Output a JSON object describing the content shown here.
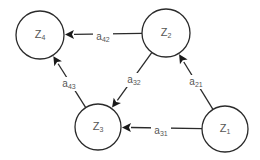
{
  "diagram": {
    "type": "directed-graph",
    "colors": {
      "stroke": "#2a2a2a",
      "text": "#555555",
      "background": "#ffffff"
    },
    "nodes": [
      {
        "id": "Z4",
        "base": "Z",
        "sub": "4",
        "cx": 40,
        "cy": 35,
        "r": 24
      },
      {
        "id": "Z2",
        "base": "Z",
        "sub": "2",
        "cx": 166,
        "cy": 33,
        "r": 24
      },
      {
        "id": "Z3",
        "base": "Z",
        "sub": "3",
        "cx": 98,
        "cy": 127,
        "r": 23
      },
      {
        "id": "Z1",
        "base": "Z",
        "sub": "1",
        "cx": 225,
        "cy": 129,
        "r": 23
      }
    ],
    "edges": [
      {
        "id": "a42",
        "from": "Z2",
        "to": "Z4",
        "base": "a",
        "sub": "42",
        "lx": 103,
        "ly": 37
      },
      {
        "id": "a32",
        "from": "Z2",
        "to": "Z3",
        "base": "a",
        "sub": "32",
        "lx": 134,
        "ly": 80
      },
      {
        "id": "a21",
        "from": "Z1",
        "to": "Z2",
        "base": "a",
        "sub": "21",
        "lx": 196,
        "ly": 82
      },
      {
        "id": "a43",
        "from": "Z3",
        "to": "Z4",
        "base": "a",
        "sub": "43",
        "lx": 69,
        "ly": 84
      },
      {
        "id": "a31",
        "from": "Z1",
        "to": "Z3",
        "base": "a",
        "sub": "31",
        "lx": 161,
        "ly": 131
      }
    ]
  }
}
